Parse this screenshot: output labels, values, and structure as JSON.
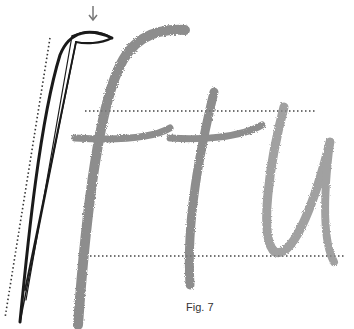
{
  "figure": {
    "caption": "Fig. 7",
    "letters": [
      "f",
      "t",
      "u"
    ],
    "annotations": {
      "arrow": "down-arrow marking top of pen-angle diagram",
      "guidelines": [
        "upper dotted line (x-height)",
        "lower dotted line (baseline)",
        "slant dotted line"
      ]
    },
    "colors": {
      "stroke_dark": "#1a1a1a",
      "pencil_gray": "#7a7a7a",
      "guide": "#555555"
    }
  }
}
